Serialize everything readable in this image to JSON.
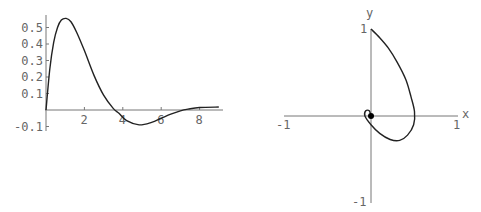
{
  "chart_data": [
    {
      "type": "line",
      "title": "",
      "xlabel": "",
      "ylabel": "",
      "xlim": [
        0,
        9.2
      ],
      "ylim": [
        -0.1,
        0.57
      ],
      "grid": false,
      "x_ticks": [
        "2",
        "4",
        "6",
        "8"
      ],
      "y_ticks": [
        "0.5",
        "0.4",
        "0.3",
        "0.2",
        "0.1",
        "-0.1"
      ],
      "series": [
        {
          "name": "f(t)",
          "x": [
            0,
            0.2,
            0.4,
            0.6,
            0.8,
            1.05,
            1.3,
            1.6,
            2,
            2.5,
            3,
            3.5,
            3.8,
            4.2,
            4.85,
            5.5,
            6,
            6.5,
            7,
            7.4,
            8,
            9
          ],
          "y": [
            0,
            0.25,
            0.41,
            0.5,
            0.545,
            0.555,
            0.535,
            0.47,
            0.36,
            0.21,
            0.09,
            0.01,
            -0.02,
            -0.065,
            -0.09,
            -0.075,
            -0.05,
            -0.025,
            -0.005,
            0.005,
            0.015,
            0.018
          ]
        }
      ]
    },
    {
      "type": "line",
      "title": "",
      "xlabel": "x",
      "ylabel": "y",
      "xlim": [
        -1,
        1
      ],
      "ylim": [
        -1,
        1
      ],
      "grid": false,
      "x_ticks": [
        "-1",
        "1"
      ],
      "y_ticks": [
        "1",
        "-1"
      ],
      "annotations": [
        {
          "type": "point",
          "x": 0,
          "y": 0
        }
      ],
      "series": [
        {
          "name": "phase curve",
          "x": [
            0,
            0.1,
            0.2,
            0.3,
            0.4,
            0.46,
            0.5,
            0.49,
            0.42,
            0.33,
            0.22,
            0.1,
            0,
            -0.07,
            -0.06,
            -0.02,
            0
          ],
          "y": [
            1,
            0.9,
            0.78,
            0.62,
            0.42,
            0.22,
            0.05,
            -0.1,
            -0.22,
            -0.28,
            -0.27,
            -0.2,
            -0.1,
            0,
            0.06,
            0.06,
            0
          ]
        }
      ]
    }
  ],
  "left_plot": {
    "x_ticks": [
      {
        "label": "2",
        "value": 2
      },
      {
        "label": "4",
        "value": 4
      },
      {
        "label": "6",
        "value": 6
      },
      {
        "label": "8",
        "value": 8
      }
    ],
    "y_ticks": [
      {
        "label": "0.5",
        "value": 0.5
      },
      {
        "label": "0.4",
        "value": 0.4
      },
      {
        "label": "0.3",
        "value": 0.3
      },
      {
        "label": "0.2",
        "value": 0.2
      },
      {
        "label": "0.1",
        "value": 0.1
      },
      {
        "label": "-0.1",
        "value": -0.1
      }
    ]
  },
  "right_plot": {
    "x_axis_label": "x",
    "y_axis_label": "y",
    "x_tick_neg": "-1",
    "x_tick_pos": "1",
    "y_tick_pos": "1",
    "y_tick_neg": "-1"
  }
}
